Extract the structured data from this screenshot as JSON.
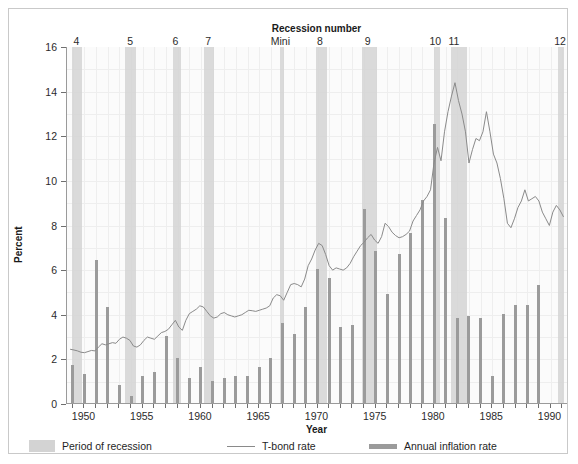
{
  "chart_data": {
    "type": "line",
    "title": "",
    "xlabel": "Year",
    "ylabel": "Percent",
    "top_axis_label": "Recession number",
    "xlim": [
      1948.5,
      1991.5
    ],
    "ylim": [
      0,
      16
    ],
    "yticks": [
      0,
      2,
      4,
      6,
      8,
      10,
      12,
      14,
      16
    ],
    "xticks": [
      1950,
      1955,
      1960,
      1965,
      1970,
      1975,
      1980,
      1985,
      1990
    ],
    "grid": true,
    "legend_position": "below-plot",
    "legend": [
      {
        "label": "Period of recession",
        "marker": "band",
        "color": "#d3d3d3"
      },
      {
        "label": "T-bond rate",
        "marker": "line",
        "color": "#8a8a8a"
      },
      {
        "label": "Annual inflation rate",
        "marker": "bar",
        "color": "#9b9b9b"
      }
    ],
    "recessions": [
      {
        "number": "4",
        "start": 1948.9,
        "end": 1949.8,
        "label_x": 1949.4
      },
      {
        "number": "5",
        "start": 1953.5,
        "end": 1954.4,
        "label_x": 1954.0
      },
      {
        "number": "6",
        "start": 1957.6,
        "end": 1958.3,
        "label_x": 1957.9
      },
      {
        "number": "7",
        "start": 1960.3,
        "end": 1961.1,
        "label_x": 1960.7
      },
      {
        "number": "Mini",
        "start": 1966.8,
        "end": 1967.1,
        "label_x": 1966.9
      },
      {
        "number": "8",
        "start": 1969.9,
        "end": 1970.8,
        "label_x": 1970.3
      },
      {
        "number": "9",
        "start": 1973.8,
        "end": 1975.1,
        "label_x": 1974.4
      },
      {
        "number": "10",
        "start": 1980.0,
        "end": 1980.5,
        "label_x": 1980.2
      },
      {
        "number": "11",
        "start": 1981.5,
        "end": 1982.8,
        "label_x": 1981.8
      },
      {
        "number": "12",
        "start": 1990.6,
        "end": 1991.2,
        "label_x": 1990.9
      }
    ],
    "series": [
      {
        "name": "Annual inflation rate",
        "type": "bar",
        "color": "#9b9b9b",
        "x": [
          1949,
          1950,
          1951,
          1952,
          1953,
          1954,
          1955,
          1956,
          1957,
          1958,
          1959,
          1960,
          1961,
          1962,
          1963,
          1964,
          1965,
          1966,
          1967,
          1968,
          1969,
          1970,
          1971,
          1972,
          1973,
          1974,
          1975,
          1976,
          1977,
          1978,
          1979,
          1980,
          1981,
          1982,
          1983,
          1984,
          1985,
          1986,
          1987,
          1988,
          1989,
          1990
        ],
        "values": [
          1.7,
          1.3,
          6.4,
          4.3,
          0.8,
          0.3,
          1.2,
          1.4,
          3.0,
          2.0,
          1.1,
          1.6,
          1.0,
          1.1,
          1.2,
          1.2,
          1.6,
          2.0,
          3.6,
          3.1,
          4.3,
          6.0,
          5.6,
          3.4,
          3.5,
          8.7,
          6.8,
          4.9,
          6.7,
          7.6,
          9.1,
          12.5,
          8.3,
          3.8,
          3.9,
          3.8,
          1.2,
          4.0,
          4.4,
          4.4,
          5.3,
          0.0
        ]
      },
      {
        "name": "T-bond rate",
        "type": "line",
        "color": "#8a8a8a",
        "x": [
          1948.8,
          1949.1,
          1949.4,
          1949.7,
          1950.0,
          1950.3,
          1950.6,
          1950.9,
          1951.2,
          1951.5,
          1951.8,
          1952.1,
          1952.4,
          1952.7,
          1953.0,
          1953.3,
          1953.6,
          1953.9,
          1954.2,
          1954.5,
          1954.8,
          1955.1,
          1955.4,
          1955.7,
          1956.0,
          1956.3,
          1956.6,
          1956.9,
          1957.2,
          1957.5,
          1957.8,
          1958.1,
          1958.4,
          1958.7,
          1959.0,
          1959.3,
          1959.6,
          1959.9,
          1960.2,
          1960.5,
          1960.8,
          1961.1,
          1961.4,
          1961.7,
          1962.0,
          1962.3,
          1962.6,
          1962.9,
          1963.2,
          1963.5,
          1963.8,
          1964.1,
          1964.4,
          1964.7,
          1965.0,
          1965.3,
          1965.6,
          1965.9,
          1966.2,
          1966.5,
          1966.8,
          1967.1,
          1967.4,
          1967.7,
          1968.0,
          1968.3,
          1968.6,
          1968.9,
          1969.2,
          1969.5,
          1969.8,
          1970.1,
          1970.4,
          1970.7,
          1971.0,
          1971.3,
          1971.6,
          1971.9,
          1972.2,
          1972.5,
          1972.8,
          1973.1,
          1973.4,
          1973.7,
          1974.0,
          1974.3,
          1974.6,
          1974.9,
          1975.2,
          1975.5,
          1975.8,
          1976.1,
          1976.4,
          1976.7,
          1977.0,
          1977.3,
          1977.6,
          1977.9,
          1978.2,
          1978.5,
          1978.8,
          1979.1,
          1979.4,
          1979.7,
          1980.0,
          1980.3,
          1980.6,
          1980.9,
          1981.2,
          1981.5,
          1981.8,
          1982.1,
          1982.4,
          1982.7,
          1983.0,
          1983.3,
          1983.6,
          1983.9,
          1984.2,
          1984.5,
          1984.8,
          1985.1,
          1985.4,
          1985.7,
          1986.0,
          1986.3,
          1986.6,
          1986.9,
          1987.2,
          1987.5,
          1987.8,
          1988.1,
          1988.4,
          1988.7,
          1989.0,
          1989.3,
          1989.6,
          1989.9,
          1990.2,
          1990.5,
          1990.8,
          1991.1
        ],
        "values": [
          2.45,
          2.42,
          2.38,
          2.32,
          2.3,
          2.35,
          2.4,
          2.38,
          2.55,
          2.7,
          2.65,
          2.7,
          2.75,
          2.72,
          2.9,
          3.0,
          2.95,
          2.85,
          2.6,
          2.55,
          2.65,
          2.85,
          3.0,
          2.95,
          2.9,
          3.05,
          3.2,
          3.25,
          3.35,
          3.55,
          3.75,
          3.45,
          3.3,
          3.75,
          4.05,
          4.15,
          4.25,
          4.4,
          4.35,
          4.15,
          3.95,
          3.85,
          3.9,
          4.05,
          4.1,
          4.0,
          3.95,
          3.9,
          3.95,
          4.0,
          4.1,
          4.2,
          4.18,
          4.15,
          4.2,
          4.25,
          4.3,
          4.4,
          4.75,
          4.9,
          4.85,
          4.65,
          5.0,
          5.35,
          5.4,
          5.35,
          5.25,
          5.6,
          6.2,
          6.5,
          6.9,
          7.2,
          7.1,
          6.7,
          6.2,
          6.0,
          6.1,
          6.05,
          6.0,
          6.1,
          6.3,
          6.6,
          6.85,
          7.1,
          7.25,
          7.45,
          7.6,
          7.35,
          7.2,
          7.5,
          8.1,
          7.95,
          7.7,
          7.55,
          7.45,
          7.5,
          7.6,
          7.75,
          8.2,
          8.45,
          8.7,
          9.1,
          9.3,
          9.6,
          10.8,
          11.5,
          10.9,
          12.2,
          13.1,
          13.8,
          14.4,
          13.6,
          13.0,
          12.2,
          10.8,
          11.4,
          11.9,
          11.8,
          12.2,
          13.1,
          12.2,
          11.2,
          10.8,
          10.1,
          9.2,
          8.1,
          7.9,
          8.3,
          8.8,
          9.1,
          9.6,
          9.1,
          9.2,
          9.3,
          9.1,
          8.6,
          8.3,
          8.0,
          8.6,
          8.9,
          8.7,
          8.4
        ]
      }
    ]
  }
}
